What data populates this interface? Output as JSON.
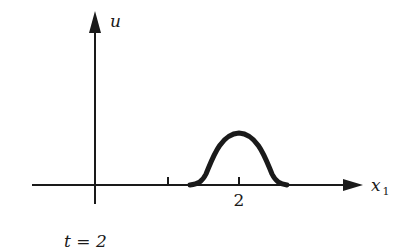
{
  "diagram": {
    "axes": {
      "vertical_label": "u",
      "horizontal_label": "x",
      "horizontal_label_subscript": "1"
    },
    "ticks": [
      {
        "position": 1,
        "label": ""
      },
      {
        "position": 2,
        "label": "2"
      }
    ],
    "curve": {
      "shape": "bump",
      "center": 2,
      "description": "smooth bell-shaped pulse centered at x1 = 2"
    },
    "caption": "t = 2",
    "colors": {
      "ink": "#1a1a1a",
      "background": "#ffffff"
    }
  }
}
